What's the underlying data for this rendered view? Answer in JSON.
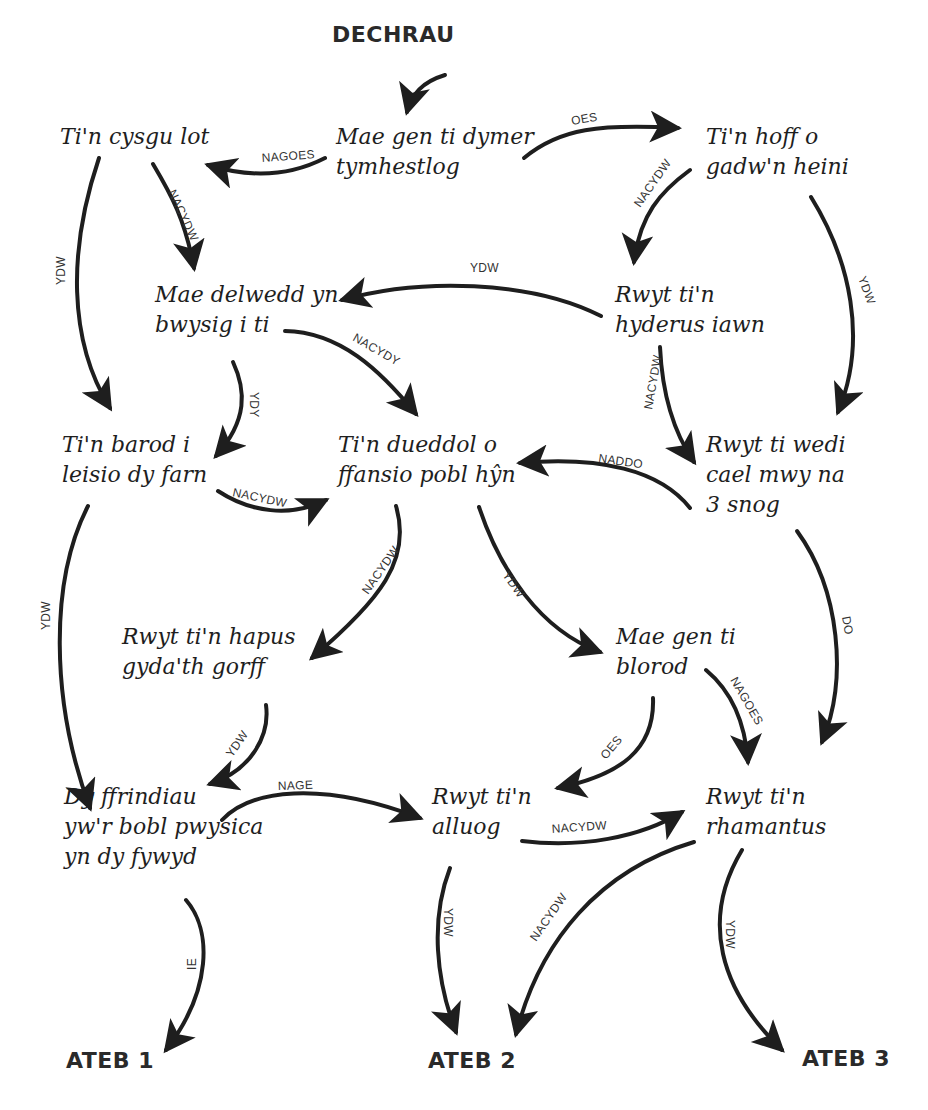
{
  "diagram": {
    "type": "flowchart",
    "language": "Welsh",
    "colors": {
      "ink": "#1e1e1e",
      "label": "#333333",
      "background": "#ffffff"
    },
    "start": {
      "id": "start",
      "label": "DECHRAU",
      "x": 332,
      "y": 22
    },
    "nodes": [
      {
        "id": "n1",
        "lines": [
          "Mae gen ti dymer",
          "tymhestlog"
        ],
        "x": 336,
        "y": 122
      },
      {
        "id": "n2",
        "lines": [
          "Ti'n cysgu lot"
        ],
        "x": 60,
        "y": 122
      },
      {
        "id": "n3",
        "lines": [
          "Ti'n hoff o",
          "gadw'n heini"
        ],
        "x": 706,
        "y": 122
      },
      {
        "id": "n4",
        "lines": [
          "Mae delwedd yn",
          "bwysig i ti"
        ],
        "x": 155,
        "y": 280
      },
      {
        "id": "n5",
        "lines": [
          "Rwyt ti'n",
          "hyderus iawn"
        ],
        "x": 615,
        "y": 280
      },
      {
        "id": "n6",
        "lines": [
          "Ti'n barod i",
          "leisio dy farn"
        ],
        "x": 62,
        "y": 430
      },
      {
        "id": "n7",
        "lines": [
          "Ti'n dueddol o",
          "ffansio pobl hŷn"
        ],
        "x": 338,
        "y": 430
      },
      {
        "id": "n8",
        "lines": [
          "Rwyt ti wedi",
          "cael mwy na",
          "3 snog"
        ],
        "x": 706,
        "y": 430
      },
      {
        "id": "n9",
        "lines": [
          "Rwyt ti'n hapus",
          "gyda'th gorff"
        ],
        "x": 122,
        "y": 622
      },
      {
        "id": "n10",
        "lines": [
          "Mae gen ti",
          "blorod"
        ],
        "x": 616,
        "y": 622
      },
      {
        "id": "n11",
        "lines": [
          "Dy ffrindiau",
          "yw'r bobl pwysica",
          "yn dy fywyd"
        ],
        "x": 64,
        "y": 782
      },
      {
        "id": "n12",
        "lines": [
          "Rwyt ti'n",
          "alluog"
        ],
        "x": 432,
        "y": 782
      },
      {
        "id": "n13",
        "lines": [
          "Rwyt ti'n",
          "rhamantus"
        ],
        "x": 706,
        "y": 782
      }
    ],
    "answers": [
      {
        "id": "a1",
        "label": "ATEB 1",
        "x": 66,
        "y": 1048
      },
      {
        "id": "a2",
        "label": "ATEB 2",
        "x": 428,
        "y": 1048
      },
      {
        "id": "a3",
        "label": "ATEB 3",
        "x": 802,
        "y": 1046
      }
    ],
    "edges": [
      {
        "from": "start",
        "to": "n1",
        "label": "",
        "d": "M 445 75 C 422 82, 412 94, 407 112",
        "lx": 0,
        "ly": 0,
        "rot": 0
      },
      {
        "from": "n1",
        "to": "n2",
        "label": "NAGOES",
        "d": "M 325 158 C 290 176, 250 178, 208 165",
        "lx": 262,
        "ly": 162,
        "rot": -4
      },
      {
        "from": "n1",
        "to": "n3",
        "label": "OES",
        "d": "M 524 158 C 560 128, 600 124, 678 128",
        "lx": 572,
        "ly": 125,
        "rot": -10
      },
      {
        "from": "n2",
        "to": "n6",
        "label": "YDW",
        "d": "M 99 158 C 68 250, 68 340, 110 408",
        "lx": 65,
        "ly": 285,
        "rot": -90
      },
      {
        "from": "n2",
        "to": "n4",
        "label": "NACYDW",
        "d": "M 153 164 C 172 196, 185 220, 194 268",
        "lx": 168,
        "ly": 192,
        "rot": 65
      },
      {
        "from": "n3",
        "to": "n5",
        "label": "NACYDW",
        "d": "M 690 170 C 660 192, 640 215, 634 262",
        "lx": 640,
        "ly": 208,
        "rot": -55
      },
      {
        "from": "n3",
        "to": "n8",
        "label": "YDW",
        "d": "M 811 197 C 850 260, 868 340, 838 412",
        "lx": 858,
        "ly": 278,
        "rot": 70
      },
      {
        "from": "n5",
        "to": "n4",
        "label": "YDW",
        "d": "M 601 316 C 530 280, 420 278, 342 300",
        "lx": 470,
        "ly": 272,
        "rot": 0
      },
      {
        "from": "n4",
        "to": "n7",
        "label": "NACYDY",
        "d": "M 285 331 C 340 332, 380 370, 416 414",
        "lx": 352,
        "ly": 340,
        "rot": 30
      },
      {
        "from": "n4",
        "to": "n6",
        "label": "YDY",
        "d": "M 233 362 C 246 390, 248 420, 216 456",
        "lx": 250,
        "ly": 392,
        "rot": 90
      },
      {
        "from": "n5",
        "to": "n8",
        "label": "NACYDW",
        "d": "M 660 347 C 662 390, 672 430, 694 462",
        "lx": 652,
        "ly": 410,
        "rot": -80
      },
      {
        "from": "n8",
        "to": "n7",
        "label": "NADDO",
        "d": "M 690 508 C 660 470, 600 456, 520 463",
        "lx": 598,
        "ly": 462,
        "rot": 8
      },
      {
        "from": "n6",
        "to": "n7",
        "label": "NACYDW",
        "d": "M 218 491 C 250 512, 290 518, 326 500",
        "lx": 232,
        "ly": 496,
        "rot": 12
      },
      {
        "from": "n6",
        "to": "n11",
        "label": "YDW",
        "d": "M 88 506 C 50 580, 50 700, 90 808",
        "lx": 50,
        "ly": 630,
        "rot": -90
      },
      {
        "from": "n7",
        "to": "n9",
        "label": "NACYDW",
        "d": "M 396 506 C 412 560, 380 600, 312 658",
        "lx": 368,
        "ly": 595,
        "rot": -55
      },
      {
        "from": "n7",
        "to": "n10",
        "label": "YDW",
        "d": "M 479 507 C 500 570, 540 630, 600 652",
        "lx": 502,
        "ly": 575,
        "rot": 55
      },
      {
        "from": "n8",
        "to": "n13",
        "label": "DO",
        "d": "M 797 531 C 840 590, 848 680, 822 742",
        "lx": 842,
        "ly": 617,
        "rot": 80
      },
      {
        "from": "n9",
        "to": "n11",
        "label": "YDW",
        "d": "M 266 705 C 270 735, 252 770, 210 784",
        "lx": 232,
        "ly": 758,
        "rot": -55
      },
      {
        "from": "n10",
        "to": "n12",
        "label": "OES",
        "d": "M 653 698 C 655 750, 620 775, 558 788",
        "lx": 606,
        "ly": 760,
        "rot": -50
      },
      {
        "from": "n10",
        "to": "n13",
        "label": "NAGOES",
        "d": "M 706 670 C 730 690, 745 720, 748 762",
        "lx": 730,
        "ly": 680,
        "rot": 60
      },
      {
        "from": "n11",
        "to": "n12",
        "label": "NAGE",
        "d": "M 222 820 C 250 790, 320 780, 420 818",
        "lx": 278,
        "ly": 790,
        "rot": -2
      },
      {
        "from": "n12",
        "to": "n13",
        "label": "NACYDW",
        "d": "M 522 841 C 580 848, 640 838, 682 812",
        "lx": 552,
        "ly": 833,
        "rot": -4
      },
      {
        "from": "n11",
        "to": "a1",
        "label": "IE",
        "d": "M 186 900 C 212 930, 212 990, 166 1050",
        "lx": 196,
        "ly": 970,
        "rot": -90
      },
      {
        "from": "n12",
        "to": "a2",
        "label": "YDW",
        "d": "M 450 868 C 430 920, 436 980, 456 1032",
        "lx": 444,
        "ly": 908,
        "rot": 90
      },
      {
        "from": "n13",
        "to": "a2",
        "label": "NACYDW",
        "d": "M 694 842 C 600 870, 540 940, 516 1034",
        "lx": 536,
        "ly": 942,
        "rot": -55
      },
      {
        "from": "n13",
        "to": "a3",
        "label": "YDW",
        "d": "M 742 850 C 700 920, 720 990, 782 1050",
        "lx": 726,
        "ly": 920,
        "rot": 90
      }
    ]
  }
}
